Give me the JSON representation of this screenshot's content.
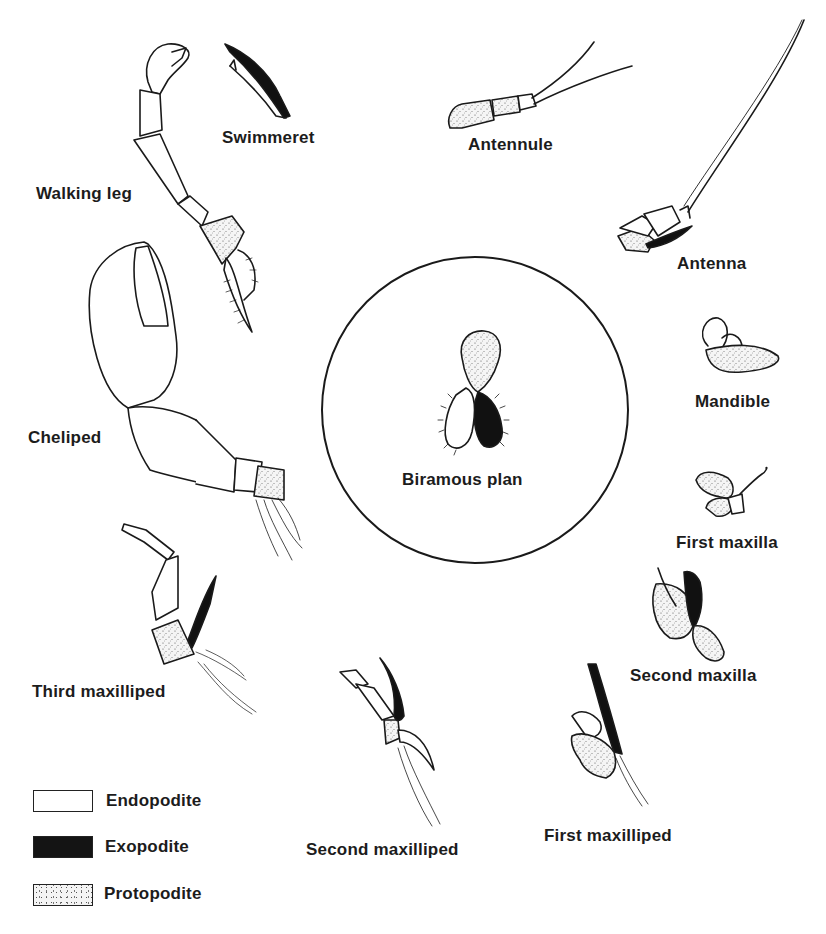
{
  "figure": {
    "center": {
      "label": "Biramous plan"
    },
    "appendages": [
      {
        "id": "swimmeret",
        "label": "Swimmeret"
      },
      {
        "id": "walking-leg",
        "label": "Walking leg"
      },
      {
        "id": "antennule",
        "label": "Antennule"
      },
      {
        "id": "antenna",
        "label": "Antenna"
      },
      {
        "id": "mandible",
        "label": "Mandible"
      },
      {
        "id": "cheliped",
        "label": "Cheliped"
      },
      {
        "id": "first-maxilla",
        "label": "First maxilla"
      },
      {
        "id": "second-maxilla",
        "label": "Second maxilla"
      },
      {
        "id": "third-maxilliped",
        "label": "Third maxilliped"
      },
      {
        "id": "second-maxilliped",
        "label": "Second maxilliped"
      },
      {
        "id": "first-maxilliped",
        "label": "First maxilliped"
      }
    ],
    "legend": [
      {
        "label": "Endopodite",
        "fill": "white"
      },
      {
        "label": "Exopodite",
        "fill": "black"
      },
      {
        "label": "Protopodite",
        "fill": "stippled"
      }
    ]
  },
  "colors": {
    "ink": "#1a1a1a",
    "background": "#ffffff",
    "stipple": "#555555"
  }
}
